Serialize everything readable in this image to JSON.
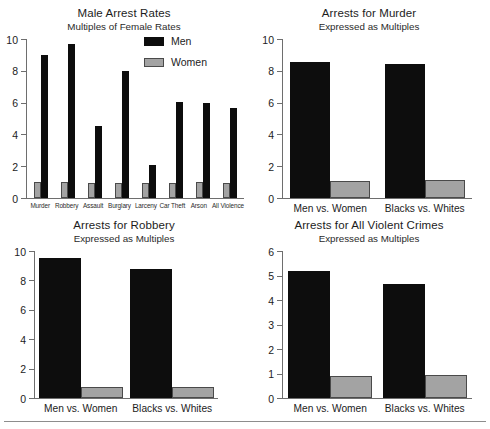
{
  "page": {
    "background_color": "#ffffff",
    "series_colors": {
      "men": "#0d0d0d",
      "women": "#a3a3a3"
    }
  },
  "charts": [
    {
      "id": "male-arrest-rates",
      "title": "Male Arrest Rates",
      "subtitle": "Multiples of Female Rates",
      "legend": [
        {
          "label": "Men",
          "color": "#0d0d0d"
        },
        {
          "label": "Women",
          "color": "#a3a3a3"
        }
      ]
    },
    {
      "id": "murder",
      "title": "Arrests for Murder",
      "subtitle": "Expressed as Multiples"
    },
    {
      "id": "robbery",
      "title": "Arrests for Robbery",
      "subtitle": "Expressed as Multiples"
    },
    {
      "id": "violent",
      "title": "Arrests for All Violent Crimes",
      "subtitle": "Expressed as Multiples"
    }
  ],
  "chart_data": [
    {
      "type": "bar",
      "title": "Male Arrest Rates",
      "subtitle": "Multiples of Female Rates",
      "xlabel": "",
      "ylabel": "",
      "ylim": [
        0,
        10
      ],
      "yticks": [
        0,
        2,
        4,
        6,
        8,
        10
      ],
      "ytick_labels": [
        "0",
        "2",
        "4",
        "6",
        "8",
        "10"
      ],
      "grid": false,
      "legend": [
        "Men",
        "Women"
      ],
      "legend_position": "inside-top-right",
      "categories": [
        "Murder",
        "Robbery",
        "Assault",
        "Burglary",
        "Larceny",
        "Car Theft",
        "Arson",
        "All Violence"
      ],
      "series": [
        {
          "name": "Women",
          "color": "#a3a3a3",
          "values": [
            1.0,
            1.0,
            0.95,
            0.95,
            0.95,
            0.95,
            1.0,
            0.95
          ]
        },
        {
          "name": "Men",
          "color": "#0d0d0d",
          "values": [
            9.0,
            9.7,
            4.5,
            8.0,
            2.05,
            6.05,
            5.95,
            5.65
          ]
        }
      ]
    },
    {
      "type": "bar",
      "title": "Arrests for Murder",
      "subtitle": "Expressed as Multiples",
      "xlabel": "",
      "ylabel": "",
      "ylim": [
        0,
        10
      ],
      "yticks": [
        0,
        2,
        4,
        6,
        8,
        10
      ],
      "ytick_labels": [
        "0",
        "2",
        "4",
        "6",
        "8",
        "10"
      ],
      "grid": false,
      "categories": [
        "Men vs. Women",
        "Blacks vs. Whites"
      ],
      "series": [
        {
          "name": "numerator",
          "color": "#0d0d0d",
          "values": [
            8.55,
            8.4
          ]
        },
        {
          "name": "denominator",
          "color": "#a3a3a3",
          "values": [
            1.1,
            1.15
          ]
        }
      ]
    },
    {
      "type": "bar",
      "title": "Arrests for Robbery",
      "subtitle": "Expressed as Multiples",
      "xlabel": "",
      "ylabel": "",
      "ylim": [
        0,
        10
      ],
      "yticks": [
        0,
        2,
        4,
        6,
        8,
        10
      ],
      "ytick_labels": [
        "0",
        "2",
        "4",
        "6",
        "8",
        "10"
      ],
      "grid": false,
      "categories": [
        "Men vs. Women",
        "Blacks vs. Whites"
      ],
      "series": [
        {
          "name": "numerator",
          "color": "#0d0d0d",
          "values": [
            9.5,
            8.8
          ]
        },
        {
          "name": "denominator",
          "color": "#a3a3a3",
          "values": [
            0.75,
            0.75
          ]
        }
      ]
    },
    {
      "type": "bar",
      "title": "Arrests for All Violent Crimes",
      "subtitle": "Expressed as Multiples",
      "xlabel": "",
      "ylabel": "",
      "ylim": [
        0,
        6
      ],
      "yticks": [
        0,
        1,
        2,
        3,
        4,
        5,
        6
      ],
      "ytick_labels": [
        "0",
        "1",
        "2",
        "3",
        "4",
        "5",
        "6"
      ],
      "grid": false,
      "categories": [
        "Men vs. Women",
        "Blacks vs. Whites"
      ],
      "series": [
        {
          "name": "numerator",
          "color": "#0d0d0d",
          "values": [
            5.2,
            4.65
          ]
        },
        {
          "name": "denominator",
          "color": "#a3a3a3",
          "values": [
            0.9,
            0.95
          ]
        }
      ]
    }
  ]
}
